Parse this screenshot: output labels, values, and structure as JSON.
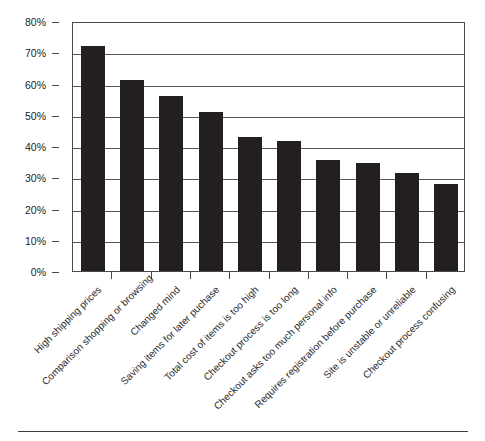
{
  "chart_data": {
    "type": "bar",
    "title": "",
    "subtitle": "",
    "xlabel": "",
    "ylabel": "",
    "ylim": [
      0,
      80
    ],
    "grid": true,
    "legend": false,
    "legend_position": "none",
    "bar_color": "#231f20",
    "axis_color": "#4a4a4a",
    "gridline_color": "#55585a",
    "y_ticks": [
      "0%",
      "10%",
      "20%",
      "30%",
      "40%",
      "50%",
      "60%",
      "70%",
      "80%"
    ],
    "y_tick_values": [
      0,
      10,
      20,
      30,
      40,
      50,
      60,
      70,
      80
    ],
    "value_suffix": "%",
    "categories": [
      "High shipping prices",
      "Comparison shopping or browsing",
      "Changed mind",
      "Saving items for later puchase",
      "Total cost of items is too high",
      "Checkout process is too long",
      "Checkout asks too much personal info",
      "Requires registration before purchase",
      "Site is unstable or unreliable",
      "Checkout process confusing"
    ],
    "values": [
      72,
      61,
      56,
      51,
      43,
      41.5,
      35.5,
      34.5,
      31.5,
      27.8
    ]
  }
}
